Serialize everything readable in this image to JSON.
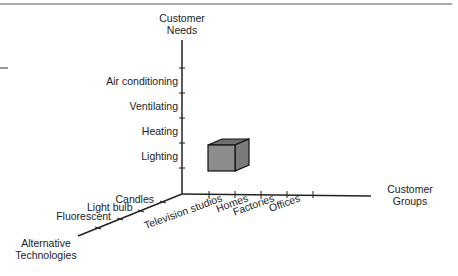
{
  "diagram": {
    "axes": {
      "vertical": {
        "title_lines": [
          "Customer",
          "Needs"
        ],
        "ticks": [
          "Lighting",
          "Heating",
          "Ventilating",
          "Air conditioning"
        ]
      },
      "horizontal": {
        "title_lines": [
          "Customer",
          "Groups"
        ],
        "ticks": [
          "Television studios",
          "Homes",
          "Factories",
          "Offices"
        ]
      },
      "diagonal": {
        "title_lines": [
          "Alternative",
          "Technologies"
        ],
        "ticks": [
          "Candles",
          "Light bulb",
          "Fluorescent"
        ]
      }
    },
    "cube": {
      "label": "business definition cube",
      "front_color": "#8c8c8c",
      "top_color": "#6e6e6e",
      "side_color": "#7b7b7b"
    },
    "line_color": "#222222"
  }
}
